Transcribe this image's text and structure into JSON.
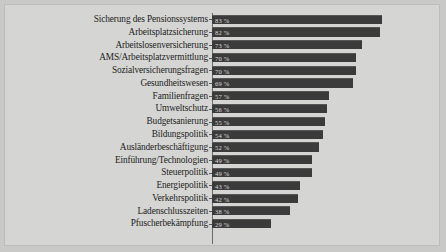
{
  "chart_data": {
    "type": "bar",
    "orientation": "horizontal",
    "title": "",
    "subtitle": "",
    "xlabel": "",
    "ylabel": "",
    "xlim": [
      0,
      100
    ],
    "grid": false,
    "legend": null,
    "value_suffix": " %",
    "bar_color": "#3b3b3b",
    "background_color": "#d5d5d3",
    "categories": [
      "Sicherung des Pensionssystems",
      "Arbeitsplatzsicherung",
      "Arbeitslosenversicherung",
      "AMS/Arbeitsplatzvermittlung",
      "Sozialversicherungsfragen",
      "Gesundheitswesen",
      "Familienfragen",
      "Umweltschutz",
      "Budgetsanierung",
      "Bildungspolitik",
      "Ausländerbeschäftigung",
      "Einführung/Technologien",
      "Steuerpolitik",
      "Energiepolitik",
      "Verkehrspolitik",
      "Ladenschlusszeiten",
      "Pfuscherbekämpfung"
    ],
    "values": [
      83,
      82,
      73,
      70,
      70,
      69,
      57,
      56,
      55,
      54,
      52,
      49,
      49,
      43,
      42,
      38,
      29
    ],
    "value_labels": [
      "83 %",
      "82 %",
      "73 %",
      "70 %",
      "70 %",
      "69 %",
      "57 %",
      "56 %",
      "55 %",
      "54 %",
      "52 %",
      "49 %",
      "49 %",
      "43 %",
      "42 %",
      "38 %",
      "29 %"
    ]
  }
}
